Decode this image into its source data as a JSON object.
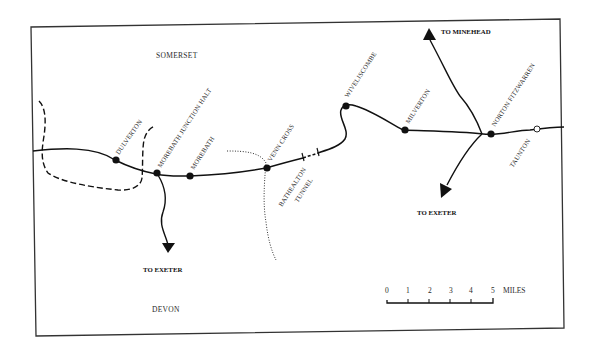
{
  "map": {
    "regions": {
      "north": "SOMERSET",
      "south": "DEVON"
    },
    "stations": [
      {
        "name": "DULVERTON"
      },
      {
        "name": "MOREBATH JUNCTION HALT"
      },
      {
        "name": "MOREBATH"
      },
      {
        "name": "VENN CROSS"
      },
      {
        "name": "WIVELISCOMBE"
      },
      {
        "name": "MILVERTON"
      },
      {
        "name": "NORTON FITZWARREN"
      },
      {
        "name": "TAUNTON"
      }
    ],
    "tunnel": {
      "line1": "BATHEALTON",
      "line2": "TUNNEL"
    },
    "destinations": {
      "minehead": "TO MINEHEAD",
      "exeter_west": "TO EXETER",
      "exeter_east": "TO EXETER"
    },
    "scale_bar": {
      "ticks": [
        "0",
        "1",
        "2",
        "3",
        "4",
        "5"
      ],
      "unit": "MILES"
    },
    "colors": {
      "line": "#111111",
      "background": "#ffffff",
      "border": "#333333"
    }
  }
}
